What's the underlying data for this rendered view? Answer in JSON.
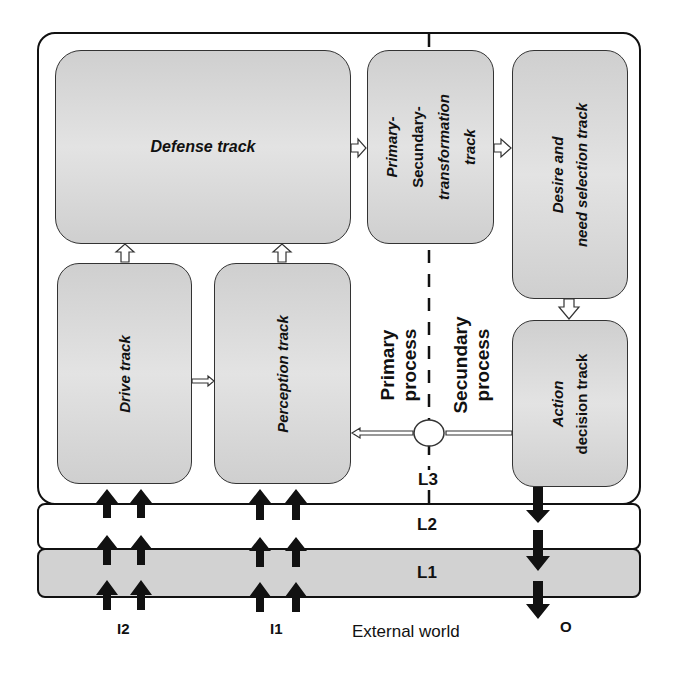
{
  "diagram": {
    "tracks": {
      "defense": {
        "label": "Defense track"
      },
      "drive": {
        "label": "Drive track"
      },
      "perception": {
        "label": "Perception track"
      },
      "primary_secundary": {
        "lines": [
          "Primary-",
          "Secundary-",
          "transformation",
          "track"
        ]
      },
      "desire": {
        "lines": [
          "Desire and",
          "need selection track"
        ]
      },
      "action": {
        "lines": [
          "Action",
          "decision track"
        ]
      }
    },
    "processes": {
      "primary": {
        "lines": [
          "Primary",
          "process"
        ]
      },
      "secondary": {
        "lines": [
          "Secundary",
          "process"
        ]
      }
    },
    "layers": {
      "l3": "L3",
      "l2": "L2",
      "l1": "L1"
    },
    "io": {
      "input_2": "I2",
      "input_1": "I1",
      "output": "O",
      "external_world": "External world"
    },
    "colors": {
      "track_fill": "#d8d8d8",
      "l1_fill": "#d0d0d0",
      "stroke": "#111111"
    }
  }
}
